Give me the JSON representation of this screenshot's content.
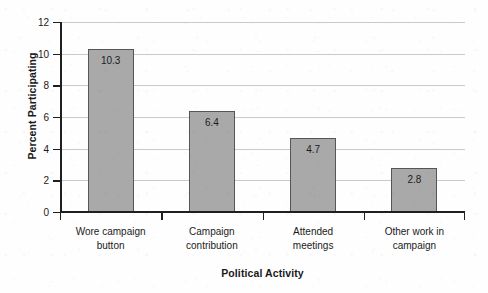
{
  "chart_data": {
    "type": "bar",
    "title": "",
    "xlabel": "Political Activity",
    "ylabel": "Percent Participating",
    "categories": [
      "Wore campaign button",
      "Campaign contribution",
      "Attended meetings",
      "Other work in campaign"
    ],
    "category_lines": [
      [
        "Wore campaign",
        "button"
      ],
      [
        "Campaign",
        "contribution"
      ],
      [
        "Attended",
        "meetings"
      ],
      [
        "Other work in",
        "campaign"
      ]
    ],
    "values": [
      10.3,
      6.4,
      4.7,
      2.8
    ],
    "value_labels": [
      "10.3",
      "6.4",
      "4.7",
      "2.8"
    ],
    "ylim": [
      0,
      12
    ],
    "yticks": [
      0,
      2,
      4,
      6,
      8,
      10,
      12
    ],
    "ytick_labels": [
      "0",
      "2",
      "4",
      "6",
      "8",
      "10",
      "12"
    ],
    "grid": true,
    "grid_axis": "y",
    "legend": false,
    "bar_fill_color": "#a9a9a9",
    "bar_border_color": "#565656",
    "gridline_color": "#c9c9c9",
    "axis_color": "#1f1f1f",
    "background_color": "#fefefe"
  }
}
